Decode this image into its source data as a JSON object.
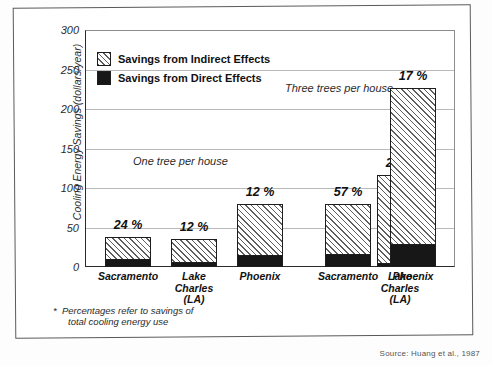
{
  "chart_data": {
    "type": "bar",
    "subtype": "stacked-bar-grouped",
    "title": "",
    "xlabel": "",
    "ylabel": "Cooling Energy Savings (dollars/year)",
    "ylim": [
      0,
      300
    ],
    "ytick_values": [
      300,
      250,
      200,
      150,
      100,
      50,
      0
    ],
    "ytick_labels": [
      "300",
      "250",
      "200",
      "150",
      "100",
      "50",
      "0"
    ],
    "grid": true,
    "legend_position": "top-left",
    "categories": [
      "Sacramento",
      "Lake Charles (LA)",
      "Phoenix",
      "Sacramento",
      "Lake Charles (LA)",
      "Phoenix"
    ],
    "series": [
      {
        "name": "Savings from Direct Effects",
        "color": "#171717",
        "values": [
          9,
          5,
          14,
          15,
          4,
          28
        ]
      },
      {
        "name": "Savings from Indirect Effects",
        "color": "#8c8c8c",
        "values": [
          29,
          31,
          66,
          65,
          112,
          199
        ]
      }
    ],
    "totals": [
      38,
      36,
      80,
      80,
      116,
      227
    ],
    "annotations": [
      "24 %",
      "12 %",
      "12 %",
      "57 %",
      "23 %",
      "17 %"
    ],
    "group_annotations": [
      "One tree per house",
      "Three trees per house"
    ],
    "footnote": "Percentages refer to savings of total cooling energy use",
    "source": "Source: Huang et al., 1987"
  },
  "axis": {
    "y_title": "Cooling Energy Savings (dollars/year)",
    "ticks": [
      {
        "label": "300",
        "value": 300
      },
      {
        "label": "250",
        "value": 250
      },
      {
        "label": "200",
        "value": 200
      },
      {
        "label": "150",
        "value": 150
      },
      {
        "label": "100",
        "value": 100
      },
      {
        "label": "50",
        "value": 50
      },
      {
        "label": "0",
        "value": 0
      }
    ]
  },
  "legend": {
    "items": [
      {
        "label": "Savings from Indirect Effects",
        "swatch": "hatched-swatch"
      },
      {
        "label": "Savings from Direct Effects",
        "swatch": "solid-black-swatch"
      }
    ]
  },
  "groups": [
    {
      "note": "One tree per house"
    },
    {
      "note": "Three trees per house"
    }
  ],
  "bars": [
    {
      "category": "Sacramento",
      "line2": "",
      "line3": "",
      "total": 38,
      "direct": 9,
      "pct": "24 %"
    },
    {
      "category": "Lake",
      "line2": "Charles",
      "line3": "(LA)",
      "total": 36,
      "direct": 5,
      "pct": "12 %"
    },
    {
      "category": "Phoenix",
      "line2": "",
      "line3": "",
      "total": 80,
      "direct": 14,
      "pct": "12 %"
    },
    {
      "category": "Sacramento",
      "line2": "",
      "line3": "",
      "total": 80,
      "direct": 15,
      "pct": "57 %"
    },
    {
      "category": "Lake",
      "line2": "Charles",
      "line3": "(LA)",
      "total": 116,
      "direct": 4,
      "pct": "23 %"
    },
    {
      "category": "Phoenix",
      "line2": "",
      "line3": "",
      "total": 227,
      "direct": 28,
      "pct": "17 %"
    }
  ],
  "footnote": {
    "marker": "*",
    "line1": "Percentages refer to savings of",
    "line2": "total cooling energy use"
  },
  "source": {
    "text": "Source: Huang et al., 1987"
  }
}
